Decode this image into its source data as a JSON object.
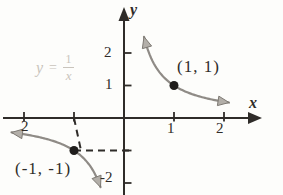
{
  "colors": {
    "ink": "#2f2c29",
    "curve": "#8f8b86",
    "arrow_fill": "#b3afa9",
    "arrow_stroke": "#7d7973",
    "dot": "#1f1d1b",
    "faded_equation": "#c9c4bc",
    "background": "#fdfdfb"
  },
  "chart_data": {
    "type": "line",
    "function": "y = 1/x",
    "equation": {
      "lhs": "y",
      "eq": "=",
      "numerator": "1",
      "denominator": "x"
    },
    "axes": {
      "x_label": "x",
      "y_label": "y",
      "x_range": [
        -2.4,
        2.75
      ],
      "y_range": [
        -2.4,
        3.4
      ],
      "grid": false
    },
    "x_ticks": [
      {
        "value": -2,
        "label": "2"
      },
      {
        "value": -1,
        "label": ""
      },
      {
        "value": 1,
        "label": "1"
      },
      {
        "value": 2,
        "label": "2"
      }
    ],
    "y_ticks": [
      {
        "value": 2,
        "label": "2"
      },
      {
        "value": 1,
        "label": "1"
      },
      {
        "value": -1,
        "label": ""
      },
      {
        "value": -2,
        "label": "-2"
      }
    ],
    "branches": [
      {
        "name": "quadrant-1-branch",
        "x_start": 0.4,
        "x_end": 2.1
      },
      {
        "name": "quadrant-3-branch",
        "x_start": -2.25,
        "x_end": -0.47
      }
    ],
    "marked_points": [
      {
        "x": 1,
        "y": 1,
        "label": "(1, 1)"
      },
      {
        "x": -1,
        "y": -1,
        "label": "(-1, -1)"
      }
    ],
    "dashed_guides": [
      {
        "from": [
          -1,
          0
        ],
        "to": [
          -1,
          -1
        ]
      },
      {
        "from": [
          -1,
          -1
        ],
        "to": [
          0,
          -1
        ]
      }
    ]
  }
}
